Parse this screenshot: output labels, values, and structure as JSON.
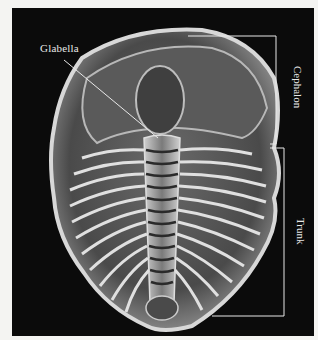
{
  "figure": {
    "labels": {
      "glabella": "Glabella",
      "cephalon": "Cephalon",
      "trunk": "Trunk"
    },
    "colors": {
      "background": "#0b0b0b",
      "label_text": "#e8e8e8",
      "page": "#f4f4f2"
    }
  }
}
